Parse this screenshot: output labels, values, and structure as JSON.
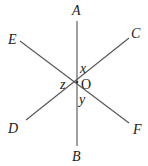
{
  "diagram": {
    "type": "intersecting-lines",
    "center_label": "O",
    "points": {
      "A": "A",
      "B": "B",
      "C": "C",
      "D": "D",
      "E": "E",
      "F": "F"
    },
    "angles": {
      "x": "x",
      "y": "y",
      "z": "z"
    },
    "lines": [
      {
        "name": "AB",
        "from": "A",
        "to": "B"
      },
      {
        "name": "CD",
        "from": "C",
        "to": "D"
      },
      {
        "name": "EF",
        "from": "E",
        "to": "F"
      }
    ]
  }
}
